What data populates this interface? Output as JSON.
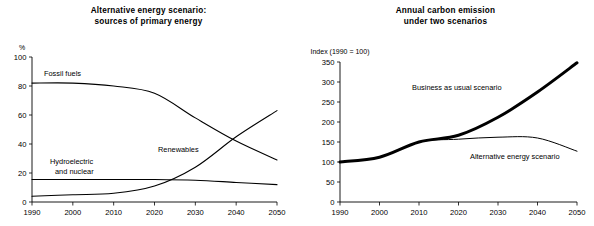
{
  "page": {
    "background_color": "#ffffff",
    "ink_color": "#000000"
  },
  "charts": [
    {
      "id": "alternative-energy-scenario",
      "type": "line",
      "title": "Alternative energy scenario:\nsources of primary energy",
      "title_lines": [
        "Alternative energy scenario:",
        "sources of primary energy"
      ],
      "ylabel": "%",
      "xlabel": "",
      "xlim": [
        1990,
        2050
      ],
      "ylim": [
        0,
        100
      ],
      "grid": false,
      "legend_position": "inline-annotations",
      "x": [
        1990,
        2000,
        2010,
        2020,
        2030,
        2040,
        2050
      ],
      "xticks": [
        "1990",
        "2000",
        "2010",
        "2020",
        "2030",
        "2040",
        "2050"
      ],
      "yticks": [
        "0",
        "20",
        "40",
        "60",
        "80",
        "100"
      ],
      "ytick_values": [
        0,
        20,
        40,
        60,
        80,
        100
      ],
      "series": [
        {
          "name": "Fossil fuels",
          "label": "Fossil fuels",
          "line_width": 1.1,
          "values": [
            82,
            82,
            80,
            75,
            58,
            42,
            29
          ]
        },
        {
          "name": "Hydroelectric and nuclear",
          "label": "Hydroelectric\nand nuclear",
          "label_lines": [
            "Hydroelectric",
            "and nuclear"
          ],
          "line_width": 1.1,
          "values": [
            15.5,
            15.5,
            15.5,
            15.5,
            15,
            13.5,
            12
          ]
        },
        {
          "name": "Renewables",
          "label": "Renewables",
          "line_width": 1.1,
          "values": [
            4,
            5,
            6,
            11,
            24,
            45,
            63
          ]
        }
      ]
    },
    {
      "id": "annual-carbon-emission",
      "type": "line",
      "title": "Annual carbon emission\nunder two scenarios",
      "title_lines": [
        "Annual carbon emission",
        "under two scenarios"
      ],
      "ylabel": "Index (1990 = 100)",
      "xlabel": "",
      "xlim": [
        1990,
        2050
      ],
      "ylim": [
        0,
        350
      ],
      "grid": false,
      "legend_position": "inline-annotations",
      "x": [
        1990,
        2000,
        2010,
        2020,
        2030,
        2040,
        2050
      ],
      "xticks": [
        "1990",
        "2000",
        "2010",
        "2020",
        "2030",
        "2040",
        "2050"
      ],
      "yticks": [
        "0",
        "50",
        "100",
        "150",
        "200",
        "250",
        "300",
        "350"
      ],
      "ytick_values": [
        0,
        50,
        100,
        150,
        200,
        250,
        300,
        350
      ],
      "series": [
        {
          "name": "Business as usual scenario",
          "label": "Business as usual scenario",
          "line_width": 3.0,
          "values": [
            100,
            112,
            150,
            167,
            212,
            275,
            348
          ]
        },
        {
          "name": "Alternative energy scenario",
          "label": "Alternative energy scenario",
          "line_width": 1.0,
          "values": [
            100,
            112,
            150,
            157,
            162,
            160,
            127
          ]
        }
      ]
    }
  ],
  "annotations": {
    "left": [
      {
        "name": "fossil-fuels-label",
        "text": "Fossil fuels",
        "x": 44,
        "y": 76
      },
      {
        "name": "renewables-label",
        "text": "Renewables",
        "x": 158,
        "y": 152
      },
      {
        "name": "hydro-nuclear-label-line1",
        "text": "Hydroelectric",
        "x": 50,
        "y": 164
      },
      {
        "name": "hydro-nuclear-label-line2",
        "text": "and nuclear",
        "x": 55,
        "y": 174
      }
    ],
    "right": [
      {
        "name": "business-as-usual-label",
        "text": "Business as usual scenario",
        "x": 412,
        "y": 90
      },
      {
        "name": "alternative-energy-label",
        "text": "Alternative energy scenario",
        "x": 470,
        "y": 159
      }
    ]
  }
}
